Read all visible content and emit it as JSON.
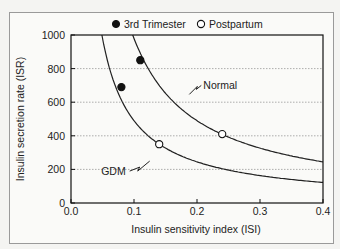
{
  "chart_data": {
    "type": "line",
    "title": "",
    "xlabel": "Insulin sensitivity index (ISI)",
    "ylabel": "Insulin secretion rate (ISR)",
    "xlim": [
      0.0,
      0.4
    ],
    "ylim": [
      0,
      1000
    ],
    "x_ticks": [
      "0.0",
      "0.1",
      "0.2",
      "0.3",
      "0.4"
    ],
    "y_ticks": [
      "0",
      "200",
      "400",
      "600",
      "800",
      "1000"
    ],
    "grid": "horizontal dotted at 200, 400, 600, 800",
    "legend": {
      "position": "top",
      "entries": [
        {
          "label": "3rd Trimester",
          "marker": "filled-circle"
        },
        {
          "label": "Postpartum",
          "marker": "open-circle"
        }
      ]
    },
    "series": [
      {
        "name": "Normal",
        "type": "hyperbola",
        "k": 98,
        "x": [
          0.1,
          0.15,
          0.2,
          0.24,
          0.3,
          0.4
        ],
        "y": [
          980,
          653,
          490,
          410,
          327,
          245
        ]
      },
      {
        "name": "GDM",
        "type": "hyperbola",
        "k": 49,
        "x": [
          0.05,
          0.08,
          0.1,
          0.14,
          0.2,
          0.3,
          0.4
        ],
        "y": [
          980,
          613,
          490,
          350,
          245,
          163,
          122
        ]
      },
      {
        "name": "3rd Trimester",
        "type": "scatter",
        "points": [
          [
            0.08,
            690
          ],
          [
            0.11,
            850
          ]
        ]
      },
      {
        "name": "Postpartum",
        "type": "scatter",
        "points": [
          [
            0.14,
            350
          ],
          [
            0.24,
            410
          ]
        ]
      }
    ],
    "annotations": [
      {
        "text": "Normal",
        "x": 0.21,
        "y": 700
      },
      {
        "text": "GDM",
        "x": 0.09,
        "y": 190
      }
    ]
  }
}
